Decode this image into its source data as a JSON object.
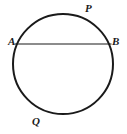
{
  "figure": {
    "kind": "circle-with-chord-diagram",
    "background_color": "#ffffff",
    "stroke_color": "#1a1a1a",
    "label_color": "#1a1a1a",
    "width": 127,
    "height": 134
  },
  "chart_data": {
    "type": "diagram",
    "title": "",
    "subtitle": "",
    "xlabel": "",
    "ylabel": "",
    "grid": false,
    "legend": null,
    "annotations": [],
    "shapes": [
      {
        "name": "circle",
        "type": "circle",
        "center": [
          63,
          64
        ],
        "radius": 50,
        "stroke": "#1a1a1a",
        "stroke_width": 2,
        "fill": "none"
      },
      {
        "name": "chord-AB",
        "type": "line",
        "from": [
          14.5,
          44
        ],
        "to": [
          111.5,
          44
        ],
        "stroke": "#1a1a1a",
        "stroke_width": 1.2
      }
    ],
    "points": [
      {
        "id": "A",
        "label": "A",
        "x": 14.5,
        "y": 44,
        "label_x": 8,
        "label_y": 36,
        "on": "circle-left-chord-endpoint"
      },
      {
        "id": "B",
        "label": "B",
        "x": 111.5,
        "y": 44,
        "label_x": 112,
        "label_y": 36,
        "on": "circle-right-chord-endpoint"
      },
      {
        "id": "P",
        "label": "P",
        "x": 93,
        "y": 26,
        "label_x": 85,
        "label_y": 3,
        "on": "major-arc-upper-right"
      },
      {
        "id": "Q",
        "label": "Q",
        "x": 40,
        "y": 111,
        "label_x": 32,
        "label_y": 116,
        "on": "arc-lower-left"
      }
    ],
    "labels": [
      "A",
      "B",
      "P",
      "Q"
    ]
  },
  "labels": {
    "A": "A",
    "B": "B",
    "P": "P",
    "Q": "Q"
  }
}
